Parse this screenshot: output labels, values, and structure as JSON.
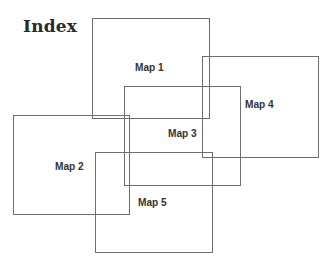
{
  "title": "Index",
  "maps": [
    {
      "label": "Map 1",
      "rect": {
        "x": 92,
        "y": 18,
        "w": 118,
        "h": 101
      },
      "label_pos": {
        "x": 135,
        "y": 61
      }
    },
    {
      "label": "Map 2",
      "rect": {
        "x": 13,
        "y": 115,
        "w": 117,
        "h": 100
      },
      "label_pos": {
        "x": 55,
        "y": 160
      }
    },
    {
      "label": "Map 3",
      "rect": {
        "x": 124,
        "y": 86,
        "w": 117,
        "h": 100
      },
      "label_pos": {
        "x": 168,
        "y": 127
      }
    },
    {
      "label": "Map 4",
      "rect": {
        "x": 202,
        "y": 56,
        "w": 117,
        "h": 102
      },
      "label_pos": {
        "x": 245,
        "y": 98
      }
    },
    {
      "label": "Map 5",
      "rect": {
        "x": 95,
        "y": 152,
        "w": 118,
        "h": 101
      },
      "label_pos": {
        "x": 138,
        "y": 196
      }
    }
  ],
  "colors": {
    "line": "#6e6e6e",
    "text": "#333333",
    "title": "#2a2a2a"
  }
}
